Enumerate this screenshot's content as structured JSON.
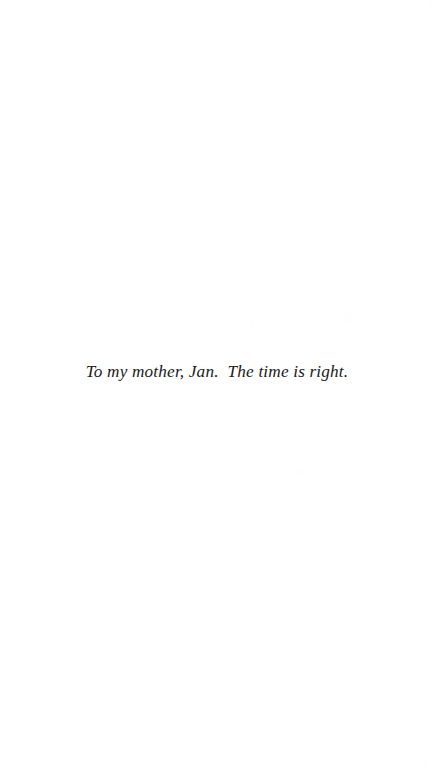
{
  "page": {
    "type": "book-dedication-page",
    "background_color": "#ffffff",
    "ink_color": "#1a1a1a",
    "width": 434,
    "height": 769
  },
  "dedication": {
    "text": "To my mother, Jan.  The time is right.",
    "alignment": "center",
    "style": "italic-serif"
  }
}
